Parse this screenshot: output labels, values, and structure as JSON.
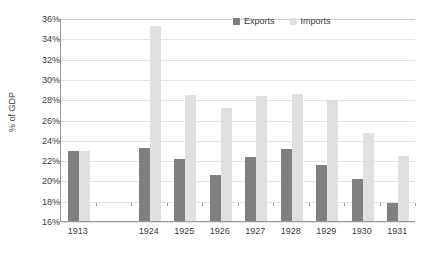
{
  "chart_data": {
    "type": "bar",
    "title": "",
    "xlabel": "",
    "ylabel": "% of GDP",
    "ylim": [
      16,
      36
    ],
    "ytick_step": 2,
    "ytick_labels": [
      "16%",
      "18%",
      "20%",
      "22%",
      "24%",
      "26%",
      "28%",
      "30%",
      "32%",
      "34%",
      "36%"
    ],
    "grid": true,
    "legend_position": "top-right",
    "categories": [
      "1913",
      "1924",
      "1925",
      "1926",
      "1927",
      "1928",
      "1929",
      "1930",
      "1931"
    ],
    "series": [
      {
        "name": "Exports",
        "color": "#808080",
        "values": [
          22.9,
          23.2,
          22.1,
          20.5,
          22.3,
          23.1,
          21.5,
          20.1,
          17.8
        ]
      },
      {
        "name": "Imports",
        "color": "#e0e0e0",
        "values": [
          22.9,
          35.2,
          28.4,
          27.1,
          28.3,
          28.5,
          27.9,
          24.7,
          22.4
        ]
      }
    ],
    "gap_after_category_index": 0
  },
  "legend": {
    "items": [
      {
        "label": "Exports",
        "color": "#808080"
      },
      {
        "label": "Imports",
        "color": "#e0e0e0"
      }
    ]
  },
  "axis": {
    "y_title": "% of GDP"
  }
}
